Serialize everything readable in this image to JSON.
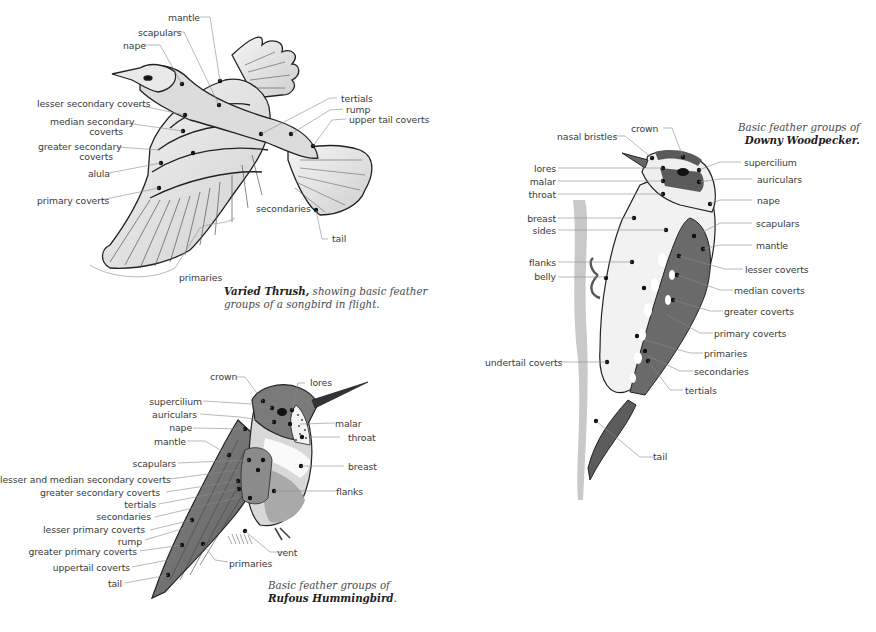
{
  "page": {
    "title": "Basic feather groups"
  },
  "thrush": {
    "caption_bold": "Varied Thrush,",
    "caption_rest_1": " showing basic feather",
    "caption_line_2": "groups of a songbird in flight.",
    "labels": {
      "mantle": "mantle",
      "scapulars": "scapulars",
      "nape": "nape",
      "lesser_secondary_coverts": "lesser secondary coverts",
      "median_secondary_coverts_1": "median secondary",
      "median_secondary_coverts_2": "coverts",
      "greater_secondary_coverts_1": "greater secondary",
      "greater_secondary_coverts_2": "coverts",
      "alula": "alula",
      "primary_coverts": "primary coverts",
      "tertials": "tertials",
      "rump": "rump",
      "upper_tail_coverts": "upper tail coverts",
      "secondaries": "secondaries",
      "tail": "tail",
      "primaries": "primaries"
    }
  },
  "woodpecker": {
    "caption_line_1": "Basic feather groups of",
    "caption_bold": "Downy Woodpecker.",
    "labels": {
      "crown": "crown",
      "nasal_bristles": "nasal bristles",
      "lores": "lores",
      "malar": "malar",
      "throat": "throat",
      "breast": "breast",
      "sides": "sides",
      "flanks": "flanks",
      "belly": "belly",
      "undertail_coverts": "undertail coverts",
      "supercilium": "supercilium",
      "auriculars": "auriculars",
      "nape": "nape",
      "scapulars": "scapulars",
      "mantle": "mantle",
      "lesser_coverts": "lesser coverts",
      "median_coverts": "median coverts",
      "greater_coverts": "greater coverts",
      "primary_coverts": "primary coverts",
      "primaries": "primaries",
      "secondaries": "secondaries",
      "tertials": "tertials",
      "tail": "tail"
    }
  },
  "hummingbird": {
    "caption_line_1": "Basic feather groups of",
    "caption_bold": "Rufous Hummingbird",
    "caption_end": ".",
    "labels": {
      "crown": "crown",
      "lores": "lores",
      "supercilium": "supercilium",
      "auriculars": "auriculars",
      "nape": "nape",
      "mantle": "mantle",
      "malar": "malar",
      "throat": "throat",
      "scapulars": "scapulars",
      "breast": "breast",
      "lesser_and_median_secondary_coverts": "lesser and median secondary coverts",
      "greater_secondary_coverts": "greater secondary coverts",
      "flanks": "flanks",
      "tertials": "tertials",
      "secondaries": "secondaries",
      "lesser_primary_coverts": "lesser primary coverts",
      "rump": "rump",
      "greater_primary_coverts": "greater primary coverts",
      "vent": "vent",
      "uppertail_coverts": "uppertail coverts",
      "primaries": "primaries",
      "tail": "tail"
    }
  },
  "colors": {
    "ink": "#1e1e1e",
    "leader": "#8a8a8a",
    "label_text": "#3a3a3a",
    "wing_gray": "#6a6a6a",
    "light_fill": "#e6e6e6"
  }
}
